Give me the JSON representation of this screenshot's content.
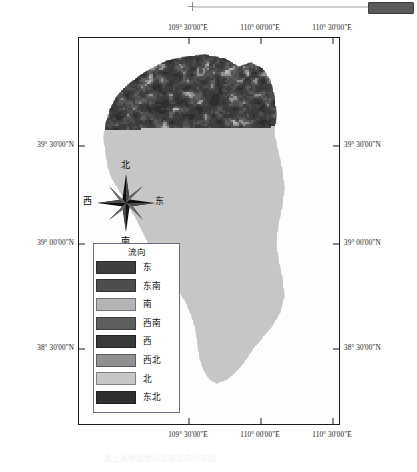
{
  "map": {
    "title_ghost": "黄土高原窟野河流域流向分布图",
    "frame": {
      "x": 78,
      "y": 37,
      "w": 262,
      "h": 388
    },
    "axis": {
      "longitude_labels": [
        "109° 30'00\"E",
        "110° 00'00\"E",
        "110° 30'00\"E"
      ],
      "longitude_tick_x": [
        110,
        182,
        254
      ],
      "latitude_labels": [
        "39° 30'00\"N",
        "39° 00'00\"N",
        "38° 30'00\"N"
      ],
      "latitude_tick_y": [
        108,
        206,
        311
      ]
    },
    "compass": {
      "north": "北",
      "south": "南",
      "east": "东",
      "west": "西",
      "icon": "compass-rose-icon"
    },
    "legend": {
      "title": "流向",
      "items": [
        {
          "label": "东",
          "color": "#3f3f3f"
        },
        {
          "label": "东南",
          "color": "#4e4e4e"
        },
        {
          "label": "南",
          "color": "#b4b4b4"
        },
        {
          "label": "西南",
          "color": "#5e5e5e"
        },
        {
          "label": "西",
          "color": "#3a3a3a"
        },
        {
          "label": "西北",
          "color": "#8f8f8f"
        },
        {
          "label": "北",
          "color": "#c6c6c6"
        },
        {
          "label": "东北",
          "color": "#2e2e2e"
        }
      ]
    }
  },
  "toolbar": {
    "scrollbar_name": "horizontal-scrollbar",
    "thumb_color": "#5a5a5a"
  },
  "chart_data": {
    "type": "heatmap",
    "title": "流向",
    "xlabel": "",
    "ylabel": "",
    "categories": [
      "东",
      "东南",
      "南",
      "西南",
      "西",
      "西北",
      "北",
      "东北"
    ],
    "values": [
      null,
      null,
      null,
      null,
      null,
      null,
      null,
      null
    ],
    "colors": [
      "#3f3f3f",
      "#4e4e4e",
      "#b4b4b4",
      "#5e5e5e",
      "#3a3a3a",
      "#8f8f8f",
      "#c6c6c6",
      "#2e2e2e"
    ],
    "xlim": [
      "109° 30'00\"E",
      "110° 30'00\"E"
    ],
    "ylim": [
      "38° 30'00\"N",
      "39° 30'00\"N"
    ],
    "grid": false,
    "legend_position": "inside-bottom-left"
  }
}
